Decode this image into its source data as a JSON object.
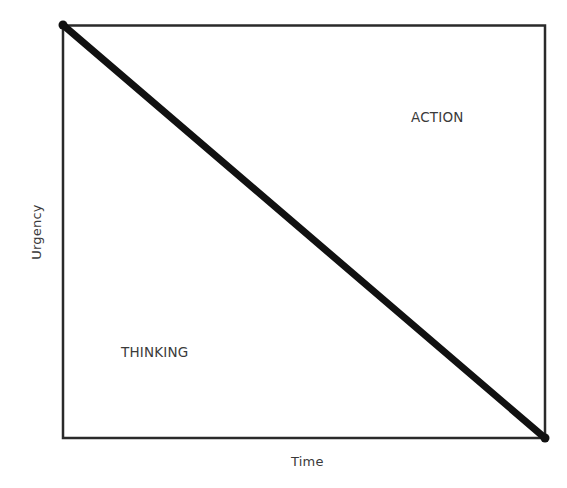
{
  "diagram": {
    "type": "quadrant-tradeoff",
    "frame": {
      "x1": 63,
      "y1": 25,
      "x2": 545,
      "y2": 438,
      "stroke_color": "#2a2a2a"
    },
    "diagonal": {
      "from": {
        "x": 63,
        "y": 25
      },
      "to": {
        "x": 545,
        "y": 438
      },
      "stroke_color": "#111111",
      "description": "Boundary line separating thinking from action; urgency decreases as time increases"
    },
    "axes": {
      "x_label": "Time",
      "y_label": "Urgency"
    },
    "regions": [
      {
        "id": "action",
        "label": "ACTION",
        "position": "upper-right"
      },
      {
        "id": "thinking",
        "label": "THINKING",
        "position": "lower-left"
      }
    ]
  }
}
